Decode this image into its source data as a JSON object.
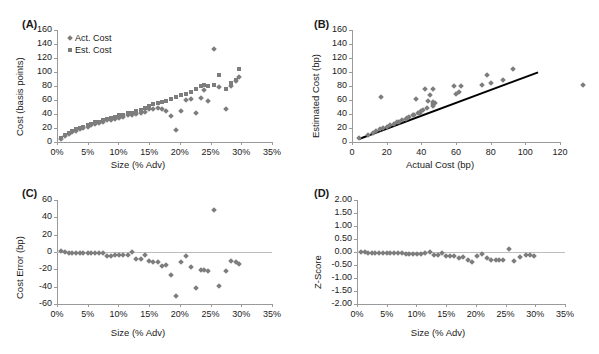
{
  "figure": {
    "marker_color": "#7d7d7d",
    "axis_color": "#9a9a9a",
    "trendline_color": "#000000"
  },
  "panels": {
    "A": {
      "label": "(A)",
      "ylabel": "Cost (basis points)",
      "xlabel": "Size (% Adv)",
      "yticks": [
        "0",
        "20",
        "40",
        "60",
        "80",
        "100",
        "120",
        "140",
        "160"
      ],
      "xticks": [
        "0%",
        "5%",
        "10%",
        "15%",
        "20%",
        "25%",
        "30%",
        "35%"
      ],
      "legend": [
        {
          "name": "Act. Cost",
          "marker": "diamond"
        },
        {
          "name": "Est. Cost",
          "marker": "square"
        }
      ]
    },
    "B": {
      "label": "(B)",
      "ylabel": "Estimated Cost (bp)",
      "xlabel": "Actual Cost (bp)",
      "yticks": [
        "0",
        "20",
        "40",
        "60",
        "80",
        "100",
        "120",
        "140",
        "160"
      ],
      "xticks": [
        "0",
        "20",
        "40",
        "60",
        "80",
        "100",
        "120"
      ]
    },
    "C": {
      "label": "(C)",
      "ylabel": "Cost Error (bp)",
      "xlabel": "Size (% Adv)",
      "yticks": [
        "-60",
        "-40",
        "-20",
        "0",
        "20",
        "40",
        "60"
      ],
      "xticks": [
        "0%",
        "5%",
        "10%",
        "15%",
        "20%",
        "25%",
        "30%",
        "35%"
      ]
    },
    "D": {
      "label": "(D)",
      "ylabel": "Z-Score",
      "xlabel": "Size (% Adv)",
      "yticks": [
        "-2.00",
        "-1.50",
        "-1.00",
        "-0.50",
        "0.00",
        "0.50",
        "1.00",
        "1.50",
        "2.00"
      ],
      "xticks": [
        "0%",
        "5%",
        "10%",
        "15%",
        "20%",
        "25%",
        "30%",
        "35%"
      ]
    }
  },
  "chart_data": [
    {
      "type": "scatter",
      "panel": "A",
      "title": "(A)",
      "xlabel": "Size (% Adv)",
      "ylabel": "Cost (basis points)",
      "xlim": [
        0,
        35
      ],
      "ylim": [
        0,
        160
      ],
      "xtick_values": [
        0,
        5,
        10,
        15,
        20,
        25,
        30,
        35
      ],
      "ytick_values": [
        0,
        20,
        40,
        60,
        80,
        100,
        120,
        140,
        160
      ],
      "grid": false,
      "legend_position": "upper-left-inside",
      "series": [
        {
          "name": "Act. Cost",
          "marker": "diamond",
          "x": [
            0.7,
            1.3,
            1.9,
            2.5,
            3.1,
            3.7,
            4.3,
            5.0,
            5.6,
            6.2,
            6.9,
            7.5,
            8.2,
            8.8,
            9.4,
            10.1,
            10.8,
            11.5,
            12.2,
            12.9,
            13.6,
            14.3,
            15.0,
            15.7,
            16.4,
            17.1,
            17.8,
            18.6,
            19.4,
            20.2,
            21.0,
            21.8,
            22.6,
            23.4,
            23.9,
            24.6,
            25.6,
            26.4,
            27.5,
            28.4,
            29.1,
            29.7
          ],
          "y": [
            4,
            9,
            12,
            14,
            16,
            18,
            20,
            22,
            24,
            26,
            27,
            29,
            31,
            32,
            33,
            35,
            36,
            38,
            39,
            40,
            41,
            43,
            47,
            47,
            48,
            47,
            44,
            37,
            17,
            45,
            60,
            62,
            42,
            63,
            75,
            59,
            133,
            78,
            47,
            80,
            87,
            93
          ]
        },
        {
          "name": "Est. Cost",
          "marker": "square",
          "x": [
            0.7,
            1.3,
            1.9,
            2.5,
            3.1,
            3.7,
            4.3,
            5.0,
            5.6,
            6.2,
            6.9,
            7.5,
            8.2,
            8.8,
            9.4,
            10.1,
            10.8,
            11.5,
            12.2,
            12.9,
            13.6,
            14.3,
            15.0,
            15.7,
            16.4,
            17.1,
            17.8,
            18.6,
            19.4,
            20.2,
            21.0,
            21.8,
            22.6,
            23.4,
            23.9,
            24.6,
            25.6,
            26.4,
            27.5,
            28.4,
            29.1,
            29.7
          ],
          "y": [
            6,
            10,
            13,
            16,
            18,
            20,
            22,
            24,
            26,
            28,
            29,
            31,
            33,
            35,
            36,
            38,
            39,
            41,
            42,
            44,
            46,
            49,
            52,
            54,
            56,
            57,
            58,
            61,
            65,
            67,
            69,
            72,
            76,
            80,
            81,
            80,
            82,
            96,
            76,
            85,
            88,
            105
          ]
        }
      ]
    },
    {
      "type": "scatter",
      "panel": "B",
      "title": "(B)",
      "xlabel": "Actual Cost (bp)",
      "ylabel": "Estimated Cost (bp)",
      "xlim": [
        0,
        120
      ],
      "ylim": [
        0,
        160
      ],
      "xtick_values": [
        0,
        20,
        40,
        60,
        80,
        100,
        120
      ],
      "ytick_values": [
        0,
        20,
        40,
        60,
        80,
        100,
        120,
        140,
        160
      ],
      "grid": false,
      "trendline": {
        "x": [
          4,
          107
        ],
        "y": [
          6,
          101
        ],
        "color": "#000000"
      },
      "series": [
        {
          "name": "Estimated vs Actual",
          "marker": "diamond",
          "x": [
            4,
            9,
            12,
            14,
            16,
            18,
            20,
            22,
            24,
            26,
            27,
            29,
            31,
            32,
            33,
            35,
            36,
            38,
            39,
            40,
            41,
            43,
            47,
            47,
            48,
            47,
            44,
            37,
            17,
            45,
            60,
            62,
            42,
            63,
            75,
            59,
            133,
            78,
            47,
            80,
            87,
            93
          ],
          "y": [
            6,
            10,
            13,
            16,
            18,
            20,
            22,
            24,
            26,
            28,
            29,
            31,
            33,
            35,
            36,
            38,
            39,
            41,
            42,
            44,
            46,
            49,
            52,
            54,
            56,
            57,
            58,
            61,
            65,
            67,
            69,
            72,
            76,
            80,
            81,
            80,
            82,
            96,
            76,
            85,
            88,
            105
          ]
        }
      ]
    },
    {
      "type": "scatter",
      "panel": "C",
      "title": "(C)",
      "xlabel": "Size (% Adv)",
      "ylabel": "Cost Error (bp)",
      "xlim": [
        0,
        35
      ],
      "ylim": [
        -60,
        60
      ],
      "xtick_values": [
        0,
        5,
        10,
        15,
        20,
        25,
        30,
        35
      ],
      "ytick_values": [
        -60,
        -40,
        -20,
        0,
        20,
        40,
        60
      ],
      "grid": false,
      "zeroline": true,
      "series": [
        {
          "name": "Cost Error",
          "marker": "diamond",
          "x": [
            0.7,
            1.3,
            1.9,
            2.5,
            3.1,
            3.7,
            4.3,
            5.0,
            5.6,
            6.2,
            6.9,
            7.5,
            8.2,
            8.8,
            9.4,
            10.1,
            10.8,
            11.5,
            12.2,
            12.9,
            13.6,
            14.3,
            15.0,
            15.7,
            16.4,
            17.1,
            17.8,
            18.6,
            19.4,
            20.2,
            21.0,
            21.8,
            22.6,
            23.4,
            23.9,
            24.6,
            25.6,
            26.4,
            27.5,
            28.4,
            29.1,
            29.7
          ],
          "y": [
            1,
            0,
            -1,
            -1,
            -1,
            -1,
            -1,
            -1,
            -1,
            -1,
            -1,
            -1,
            -5,
            -5,
            -4,
            -4,
            -4,
            -4,
            0,
            -8,
            -8,
            -3,
            -10,
            -11,
            -12,
            -16,
            -15,
            -27,
            -51,
            -11,
            -5,
            -17,
            -41,
            -21,
            -21,
            -22,
            49,
            -39,
            -22,
            -10,
            -11,
            -14
          ]
        }
      ]
    },
    {
      "type": "scatter",
      "panel": "D",
      "title": "(D)",
      "xlabel": "Size (% Adv)",
      "ylabel": "Z-Score",
      "xlim": [
        0,
        35
      ],
      "ylim": [
        -2.0,
        2.0
      ],
      "xtick_values": [
        0,
        5,
        10,
        15,
        20,
        25,
        30,
        35
      ],
      "ytick_values": [
        -2.0,
        -1.5,
        -1.0,
        -0.5,
        0.0,
        0.5,
        1.0,
        1.5,
        2.0
      ],
      "grid": false,
      "zeroline": true,
      "series": [
        {
          "name": "Z-Score",
          "marker": "diamond",
          "x": [
            0.7,
            1.3,
            1.9,
            2.5,
            3.1,
            3.7,
            4.3,
            5.0,
            5.6,
            6.2,
            6.9,
            7.5,
            8.2,
            8.8,
            9.4,
            10.1,
            10.8,
            11.5,
            12.2,
            12.9,
            13.6,
            14.3,
            15.0,
            15.7,
            16.4,
            17.1,
            17.8,
            18.6,
            19.4,
            20.2,
            21.0,
            21.8,
            22.6,
            23.4,
            23.9,
            24.6,
            25.6,
            26.4,
            27.5,
            28.4,
            29.1,
            29.7
          ],
          "y": [
            0.0,
            0.0,
            -0.02,
            -0.02,
            -0.02,
            -0.03,
            -0.03,
            -0.03,
            -0.03,
            -0.03,
            -0.04,
            -0.04,
            -0.06,
            -0.06,
            -0.06,
            -0.06,
            -0.06,
            -0.05,
            0.0,
            -0.1,
            -0.11,
            -0.05,
            -0.15,
            -0.16,
            -0.17,
            -0.22,
            -0.21,
            -0.32,
            -0.38,
            -0.17,
            -0.08,
            -0.24,
            -0.3,
            -0.29,
            -0.29,
            -0.3,
            0.12,
            -0.33,
            -0.2,
            -0.1,
            -0.11,
            -0.14
          ]
        }
      ]
    }
  ]
}
